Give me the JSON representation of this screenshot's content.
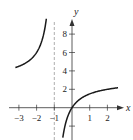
{
  "chart_data": {
    "type": "line",
    "title": "",
    "xlabel": "x",
    "ylabel": "y",
    "function": "f(x) = 3x/(x+1)",
    "vertical_asymptote": -1,
    "horizontal_asymptote": 3,
    "xlim": [
      -3.3,
      2.6
    ],
    "ylim": [
      -3,
      10
    ],
    "x_ticks": [
      -3,
      -2,
      -1,
      1,
      2
    ],
    "x_tick_labels": [
      "−3",
      "−2",
      "−1",
      "1",
      "2"
    ],
    "y_ticks": [
      2,
      4,
      6,
      8
    ],
    "y_tick_labels": [
      "2",
      "4",
      "6",
      "8"
    ],
    "grid": false,
    "series": [
      {
        "name": "left branch",
        "x": [
          -3.2,
          -3,
          -2.5,
          -2,
          -1.75,
          -1.5,
          -1.45
        ],
        "y": [
          4.36,
          4.5,
          5.0,
          6.0,
          7.0,
          9.0,
          9.67
        ]
      },
      {
        "name": "right branch",
        "x": [
          -0.5,
          -0.25,
          0,
          0.5,
          1,
          1.5,
          2,
          2.5
        ],
        "y": [
          -3.0,
          -1.0,
          0,
          1.0,
          1.5,
          1.8,
          2.0,
          2.14
        ]
      }
    ],
    "colors": {
      "curve": "#1a1a1a",
      "axis": "#333333",
      "asymptote": "#999999"
    }
  }
}
